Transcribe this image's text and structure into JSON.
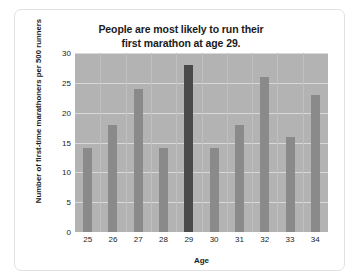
{
  "chart_data": {
    "type": "bar",
    "title": "People are most likely to run their first marathon at age 29.",
    "title_lines": [
      "People are most likely to run their",
      "first marathon at age 29."
    ],
    "xlabel": "Age",
    "ylabel": "Number of first-time marathoners per 500 runners",
    "ylabel_lines": [
      "Number of first-time marathoners",
      "per 500 runners"
    ],
    "categories": [
      "25",
      "26",
      "27",
      "28",
      "29",
      "30",
      "31",
      "32",
      "33",
      "34"
    ],
    "values": [
      14,
      18,
      24,
      14,
      28,
      14,
      18,
      26,
      16,
      23
    ],
    "highlight_category": "29",
    "ylim": [
      0,
      30
    ],
    "ytick_labels": [
      "30",
      "25",
      "20",
      "15",
      "10",
      "5",
      "0"
    ],
    "ytick_values": [
      30,
      25,
      20,
      15,
      10,
      5,
      0
    ],
    "grid": true,
    "legend": false,
    "colors": {
      "bar": "#8a8a8a",
      "bar_highlight": "#4a4a4a",
      "plot_background": "#b3b3b3",
      "gridline": "#d9d9d9",
      "page_background": "#ffffff",
      "frame_border": "#e2e2e2",
      "text": "#1b1b1b"
    }
  }
}
